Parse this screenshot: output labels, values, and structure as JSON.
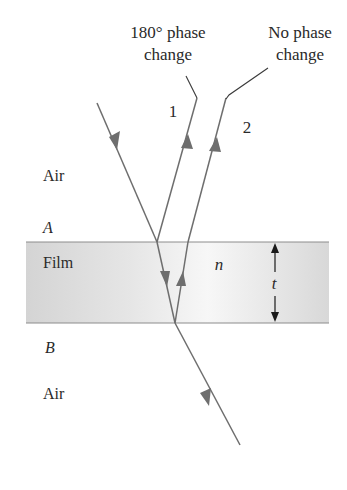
{
  "diagram": {
    "labels": {
      "phase_180_line1": "180° phase",
      "phase_180_line2": "change",
      "no_phase_line1": "No phase",
      "no_phase_line2": "change",
      "ray1": "1",
      "ray2": "2",
      "air_top": "Air",
      "interface_a": "A",
      "film": "Film",
      "index": "n",
      "thickness": "t",
      "interface_b": "B",
      "air_bottom": "Air"
    },
    "colors": {
      "ray": "#6e6e6e",
      "film_fill": "#dcdcdc",
      "film_edge": "#8c8c8c",
      "text": "#2a2a2a"
    },
    "rays": [
      {
        "name": "incident",
        "direction": "down"
      },
      {
        "name": "reflected-1",
        "direction": "up",
        "note": "180° phase change"
      },
      {
        "name": "refracted-in-film",
        "direction": "down"
      },
      {
        "name": "reflected-in-film",
        "direction": "up"
      },
      {
        "name": "reflected-2",
        "direction": "up",
        "note": "No phase change"
      },
      {
        "name": "transmitted",
        "direction": "down"
      }
    ]
  }
}
